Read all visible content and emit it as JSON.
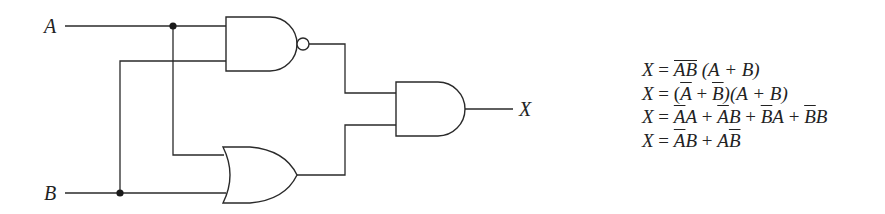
{
  "diagram": {
    "type": "logic-circuit",
    "inputs": [
      {
        "label": "A"
      },
      {
        "label": "B"
      }
    ],
    "output": {
      "label": "X"
    },
    "gates": [
      {
        "id": "g1",
        "type": "NAND",
        "inputs": [
          "A",
          "B"
        ]
      },
      {
        "id": "g2",
        "type": "OR",
        "inputs": [
          "A",
          "B"
        ]
      },
      {
        "id": "g3",
        "type": "AND",
        "inputs": [
          "g1",
          "g2"
        ],
        "output": "X"
      }
    ],
    "junctions": [
      "A-branch",
      "B-branch"
    ]
  },
  "equations": [
    {
      "lhs": "X",
      "rhs_text": "AB̅ (A + B)",
      "parts": {
        "lhs": "X",
        "eq": " = ",
        "bar_group": "AB",
        "rest": " (A + B)"
      }
    },
    {
      "lhs": "X",
      "rhs_text": "(Ā + B̄)(A + B)",
      "parts": {
        "lhs": "X",
        "eq": " = ",
        "p1": "(",
        "a": "A",
        "plus": " + ",
        "b": "B",
        "p2": ")(A + B)"
      }
    },
    {
      "lhs": "X",
      "rhs_text": "ĀA + ĀB + B̄A + B̄B",
      "parts": {
        "lhs": "X",
        "eq": " = ",
        "t1a": "A",
        "t1b": "A",
        "t2a": "A",
        "t2b": "B",
        "t3a": "B",
        "t3b": "A",
        "t4a": "B",
        "t4b": "B",
        "plus": " + "
      }
    },
    {
      "lhs": "X",
      "rhs_text": "ĀB + AB̄",
      "parts": {
        "lhs": "X",
        "eq": " = ",
        "t1a": "A",
        "t1b": "B",
        "t2a": "A",
        "t2b": "B",
        "plus": " + "
      }
    }
  ]
}
